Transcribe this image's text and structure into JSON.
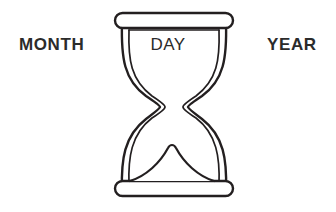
{
  "canvas": {
    "width": 336,
    "height": 212,
    "background": "#ffffff"
  },
  "theme": {
    "stroke": "#231f20",
    "text": "#2b2b2b",
    "fill": "#ffffff",
    "stroke_width": 2.4,
    "inner_stroke_width": 1.7
  },
  "diagram": {
    "name": "hourglass-date-diagram"
  },
  "labels": {
    "month": "MONTH",
    "day": "DAY",
    "year": "YEAR"
  },
  "icons": {
    "hourglass": "hourglass-icon",
    "top_cap": "hourglass-top-cap-icon",
    "bottom_cap": "hourglass-bottom-cap-icon",
    "sand_mound": "sand-mound-icon",
    "chamber_line": "top-chamber-line-icon"
  }
}
